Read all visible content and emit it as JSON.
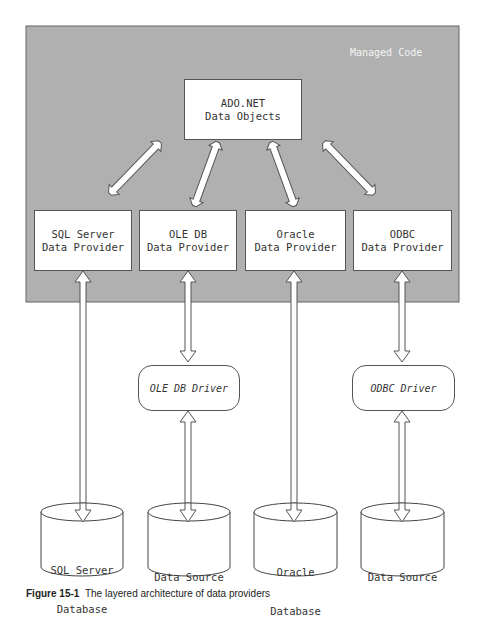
{
  "region": {
    "label": "Managed Code",
    "fill": "#b0b0b0"
  },
  "core": {
    "line1": "ADO.NET",
    "line2": "Data Objects"
  },
  "providers": [
    {
      "line1": "SQL Server",
      "line2": "Data Provider"
    },
    {
      "line1": "OLE DB",
      "line2": "Data Provider"
    },
    {
      "line1": "Oracle",
      "line2": "Data Provider"
    },
    {
      "line1": "ODBC",
      "line2": "Data Provider"
    }
  ],
  "drivers": [
    {
      "label": "OLE DB Driver"
    },
    {
      "label": "ODBC Driver"
    }
  ],
  "databases": [
    {
      "line1": "SQL Server",
      "line2": "Database"
    },
    {
      "line1": "Data Source",
      "line2": ""
    },
    {
      "line1": "Oracle",
      "line2": "Database"
    },
    {
      "line1": "Data Source",
      "line2": ""
    }
  ],
  "caption": {
    "prefix": "Figure 15-1",
    "text": "The layered architecture of data providers"
  }
}
